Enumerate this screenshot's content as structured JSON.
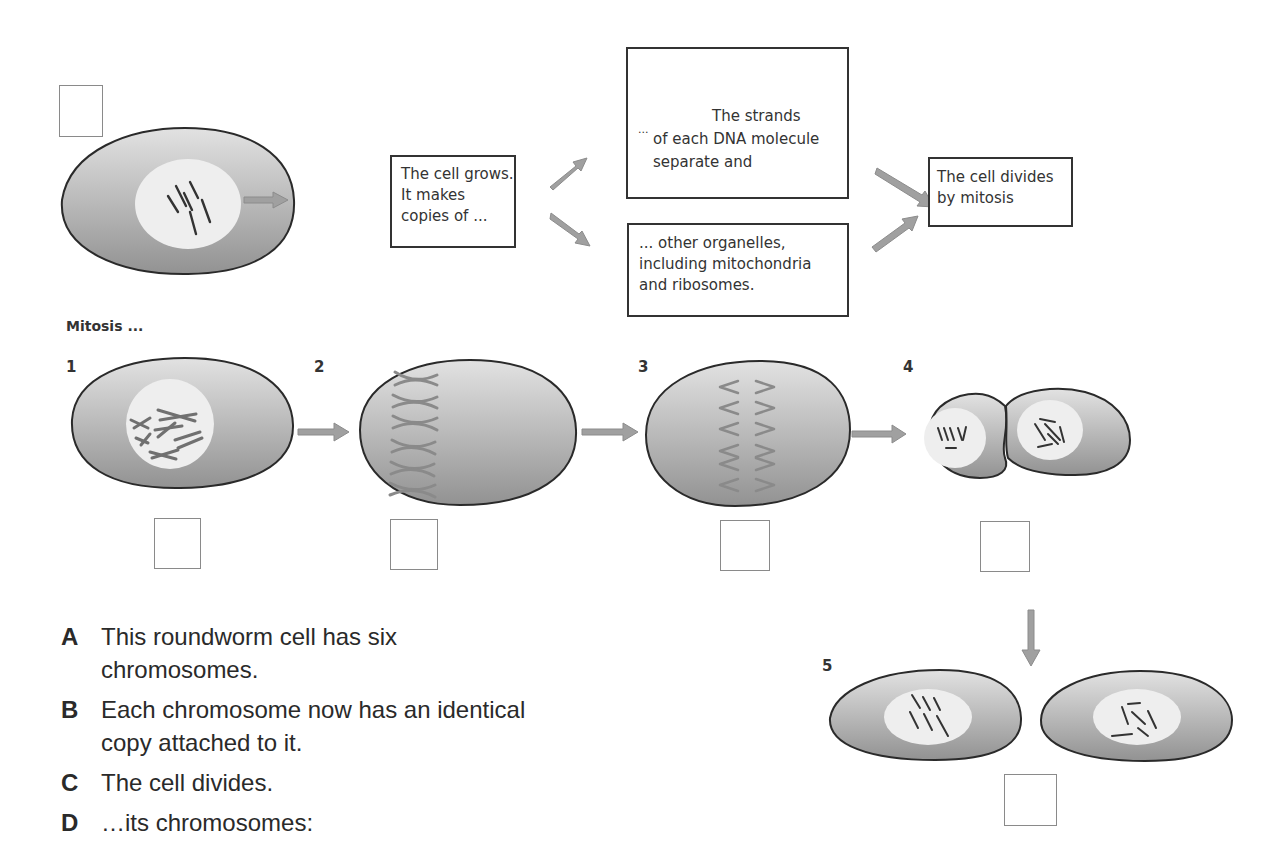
{
  "colors": {
    "cell_fill_light": "#dcdcdc",
    "cell_fill_dark": "#9a9a9a",
    "nucleus": "#eeeeee",
    "arrow": "#9b9b9b",
    "outline": "#2a2a2a"
  },
  "top_flow": {
    "box_grows": {
      "lines": [
        "The cell grows.",
        "It makes",
        "copies of ..."
      ]
    },
    "box_dna": {
      "prefix": "...",
      "line1": "The strands",
      "line2": "of each DNA molecule",
      "line3": "separate and"
    },
    "box_organelles": {
      "lines": [
        "... other organelles,",
        "including mitochondria",
        "and ribosomes."
      ]
    },
    "box_divides": {
      "lines": [
        "The cell divides",
        "by mitosis"
      ]
    }
  },
  "mitosis": {
    "heading": "Mitosis ...",
    "stages": [
      {
        "number": "1"
      },
      {
        "number": "2"
      },
      {
        "number": "3"
      },
      {
        "number": "4"
      },
      {
        "number": "5"
      }
    ]
  },
  "statements": [
    {
      "letter": "A",
      "lines": [
        "This roundworm cell has six",
        "chromosomes."
      ]
    },
    {
      "letter": "B",
      "lines": [
        "Each chromosome now has an identical",
        "copy attached to it."
      ]
    },
    {
      "letter": "C",
      "lines": [
        "The cell divides."
      ]
    },
    {
      "letter": "D",
      "lines": [
        "…its chromosomes:"
      ]
    }
  ]
}
